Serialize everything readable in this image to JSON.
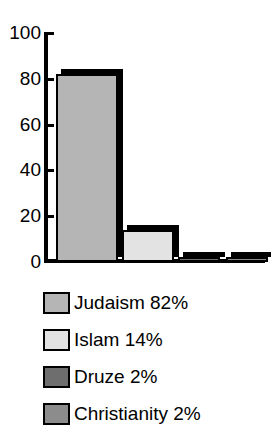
{
  "chart_data": {
    "type": "bar",
    "title": "Religion",
    "xlabel": "",
    "ylabel": "",
    "ylim": [
      0,
      100
    ],
    "yticks": [
      0,
      20,
      40,
      60,
      80,
      100
    ],
    "ytick_labels": [
      "0",
      "20",
      "40",
      "60",
      "80",
      "100"
    ],
    "grid": false,
    "legend_position": "below",
    "categories": [
      "Judaism",
      "Islam",
      "Druze",
      "Christianity"
    ],
    "values": [
      82,
      14,
      2,
      2
    ],
    "series": [
      {
        "name": "Percent of population",
        "values": [
          82,
          14,
          2,
          2
        ]
      }
    ],
    "bar_colors": [
      "#b5b5b5",
      "#e3e3e3",
      "#6e6e6e",
      "#8c8c8c"
    ],
    "bar_edge_color": "#000000",
    "shadow_color": "#000000",
    "legend": [
      {
        "label": "Judaism 82%",
        "name": "Judaism",
        "value": 82,
        "color": "#b5b5b5"
      },
      {
        "label": "Islam 14%",
        "name": "Islam",
        "value": 14,
        "color": "#e3e3e3"
      },
      {
        "label": "Druze 2%",
        "name": "Druze",
        "value": 2,
        "color": "#6e6e6e"
      },
      {
        "label": "Christianity 2%",
        "name": "Christianity",
        "value": 2,
        "color": "#8c8c8c"
      }
    ]
  }
}
